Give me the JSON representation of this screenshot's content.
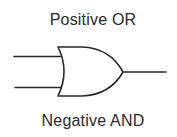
{
  "diagram": {
    "top_label": "Positive OR",
    "bottom_label": "Negative AND",
    "symbol": "or-gate",
    "inputs": 2,
    "outputs": 1,
    "stroke_color": "#2a2a2a",
    "background_color": "#ffffff"
  }
}
